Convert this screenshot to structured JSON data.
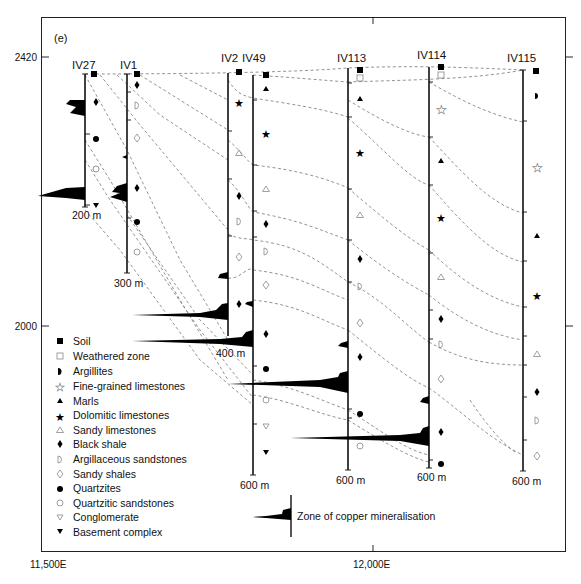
{
  "panel_label": "(e)",
  "axes": {
    "y_ticks": [
      {
        "label": "2420",
        "y": 57
      },
      {
        "label": "2000",
        "y": 326
      }
    ],
    "x_ticks": [
      {
        "label": "11,500E",
        "x": 50
      },
      {
        "label": "12,000E",
        "x": 373
      }
    ]
  },
  "boreholes": [
    {
      "name": "IV27",
      "depth_label": "200 m"
    },
    {
      "name": "IV1",
      "depth_label": "300 m"
    },
    {
      "name": "IV2",
      "depth_label": "400 m"
    },
    {
      "name": "IV49",
      "depth_label": "600 m"
    },
    {
      "name": "IV113",
      "depth_label": "600 m"
    },
    {
      "name": "IV114",
      "depth_label": "600 m"
    },
    {
      "name": "IV115",
      "depth_label": "600 m"
    }
  ],
  "legend": {
    "items": [
      {
        "symbol": "filled-square",
        "label": "Soil"
      },
      {
        "symbol": "open-square",
        "label": "Weathered zone"
      },
      {
        "symbol": "half-circle",
        "label": "Argillites"
      },
      {
        "symbol": "open-star",
        "label": "Fine-grained limestones"
      },
      {
        "symbol": "filled-triangle",
        "label": "Marls"
      },
      {
        "symbol": "filled-star",
        "label": "Dolomitic limestones"
      },
      {
        "symbol": "open-triangle",
        "label": "Sandy limestones"
      },
      {
        "symbol": "filled-diamond",
        "label": "Black shale"
      },
      {
        "symbol": "open-d",
        "label": "Argillaceous sandstones"
      },
      {
        "symbol": "open-diamond",
        "label": "Sandy shales"
      },
      {
        "symbol": "filled-circle",
        "label": "Quartzites"
      },
      {
        "symbol": "open-circle",
        "label": "Quartzitic sandstones"
      },
      {
        "symbol": "open-inverted-triangle",
        "label": "Conglomerate"
      },
      {
        "symbol": "filled-inverted-triangle",
        "label": "Basement complex"
      }
    ],
    "mineralisation_label": "Zone of copper mineralisation"
  },
  "colors": {
    "line": "#111111",
    "dashed_contact": "#777777",
    "mineral_fill": "#000000",
    "background": "#ffffff"
  }
}
